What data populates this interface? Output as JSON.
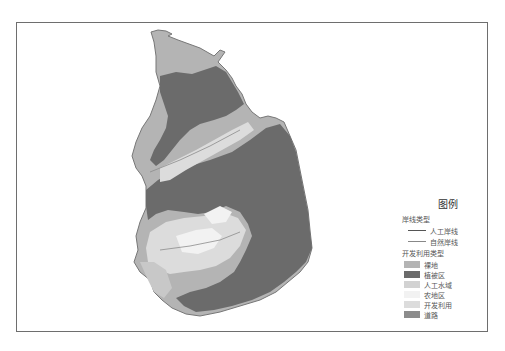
{
  "legend": {
    "title": "图例",
    "shoreline_section": "岸线类型",
    "shoreline_types": [
      {
        "label": "人工岸线",
        "color": "#555555"
      },
      {
        "label": "自然岸线",
        "color": "#888888"
      }
    ],
    "land_use_section": "开发利用类型",
    "land_use_types": [
      {
        "label": "裸地",
        "color": "#b4b4b4"
      },
      {
        "label": "植被区",
        "color": "#6b6b6b"
      },
      {
        "label": "人工水域",
        "color": "#d2d2d2"
      },
      {
        "label": "农地区",
        "color": "#f2f2f2"
      },
      {
        "label": "开发利用",
        "color": "#dcdcdc"
      },
      {
        "label": "道路",
        "color": "#8c8c8c"
      }
    ]
  },
  "colors": {
    "frame": "#6e6e6e",
    "vegetation": "#6b6b6b",
    "bare_land": "#b4b4b4",
    "developed": "#dcdcdc",
    "farmland": "#f2f2f2",
    "outline": "#777777"
  }
}
